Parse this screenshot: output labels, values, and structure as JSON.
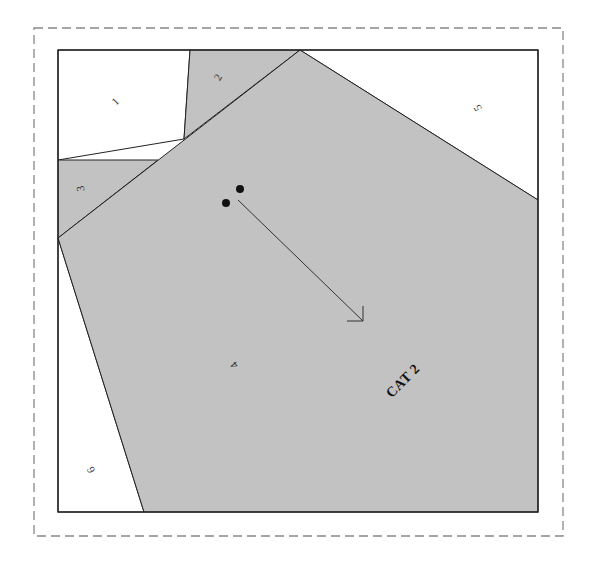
{
  "pattern": {
    "title_label": "CAT 2",
    "colors": {
      "shaded": "#c2c2c2",
      "unshaded": "#ffffff",
      "stroke": "#222222",
      "dashed_border": "#888888",
      "markers": "#111111"
    },
    "pieces": [
      {
        "number": "1",
        "shade": "white"
      },
      {
        "number": "2",
        "shade": "gray"
      },
      {
        "number": "3",
        "shade": "gray"
      },
      {
        "number": "4",
        "shade": "gray"
      },
      {
        "number": "5",
        "shade": "white"
      },
      {
        "number": "6",
        "shade": "white"
      }
    ],
    "markers": {
      "dots": 2,
      "arrow": "grainline arrow pointing down-right"
    }
  }
}
